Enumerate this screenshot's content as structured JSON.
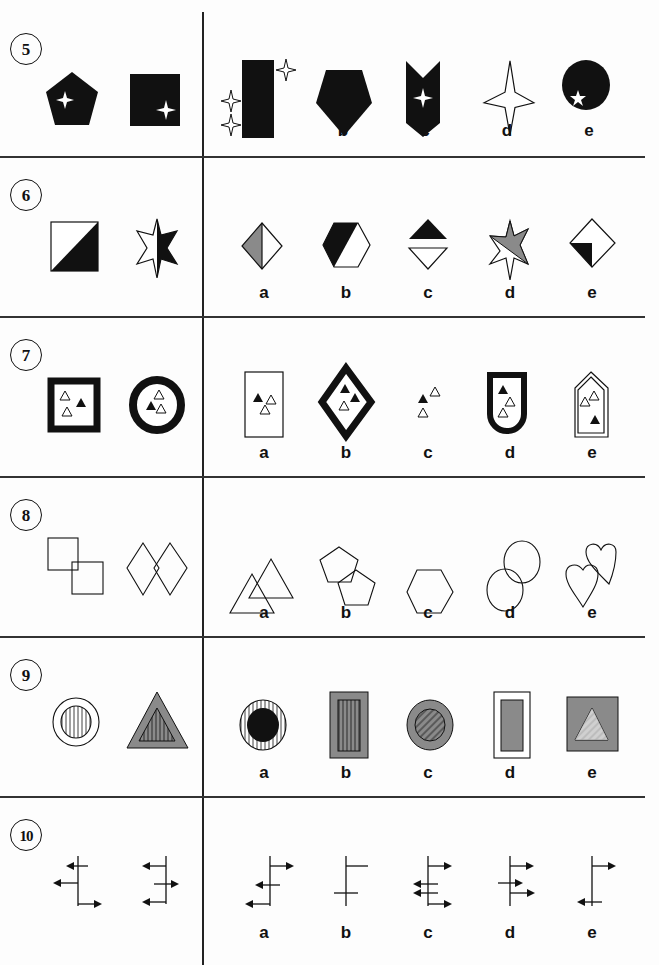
{
  "page": {
    "type": "non-verbal reasoning worksheet",
    "layout": "two-column: example pair on left, answer options a-e on right"
  },
  "questions": [
    {
      "number": "5",
      "example_pair": [
        "black pentagon with white four-point star",
        "black rectangle with white four-point star in lower right"
      ],
      "options": [
        {
          "label": "a",
          "description": "black rectangle with three outlined four-point stars outside"
        },
        {
          "label": "b",
          "description": "black pentagon pointing down"
        },
        {
          "label": "c",
          "description": "black chevron shape with white four-point star"
        },
        {
          "label": "d",
          "description": "outlined four-point star"
        },
        {
          "label": "e",
          "description": "black circle with white five-point star"
        }
      ]
    },
    {
      "number": "6",
      "example_pair": [
        "square split diagonally, lower half black",
        "six-point star, right half black"
      ],
      "options": [
        {
          "label": "a",
          "description": "diamond, left half grey"
        },
        {
          "label": "b",
          "description": "hexagon, left half black"
        },
        {
          "label": "c",
          "description": "black triangle above outlined inverted triangle"
        },
        {
          "label": "d",
          "description": "star, upper half grey"
        },
        {
          "label": "e",
          "description": "diamond with black corner at lower left"
        }
      ]
    },
    {
      "number": "7",
      "example_pair": [
        "thick black square border with three triangles",
        "thick black ring with three triangles"
      ],
      "options": [
        {
          "label": "a",
          "description": "thin rectangle with three triangles"
        },
        {
          "label": "b",
          "description": "thick black diamond with three triangles"
        },
        {
          "label": "c",
          "description": "three triangles without border"
        },
        {
          "label": "d",
          "description": "thick black shield with three triangles"
        },
        {
          "label": "e",
          "description": "double-outlined house shape with three triangles"
        }
      ]
    },
    {
      "number": "8",
      "example_pair": [
        "two overlapping squares",
        "two overlapping diamonds"
      ],
      "options": [
        {
          "label": "a",
          "description": "two overlapping triangles"
        },
        {
          "label": "b",
          "description": "two overlapping pentagons"
        },
        {
          "label": "c",
          "description": "single hexagon"
        },
        {
          "label": "d",
          "description": "two overlapping circles"
        },
        {
          "label": "e",
          "description": "two overlapping hearts"
        }
      ]
    },
    {
      "number": "9",
      "example_pair": [
        "white ring around vertically striped circle",
        "grey triangle border around striped triangle"
      ],
      "options": [
        {
          "label": "a",
          "description": "striped ring around black circle"
        },
        {
          "label": "b",
          "description": "grey rectangle frame around striped rectangle"
        },
        {
          "label": "c",
          "description": "grey ring around diagonally hatched circle"
        },
        {
          "label": "d",
          "description": "white frame around grey rectangle"
        },
        {
          "label": "e",
          "description": "grey square around hatched triangle"
        }
      ]
    },
    {
      "number": "10",
      "example_pair": [
        "vertical line with two left arrows and one right arrow",
        "vertical line with two left arrows and one right arrow (crossing)"
      ],
      "options": [
        {
          "label": "a",
          "description": "line with one right arrow, two left arrows"
        },
        {
          "label": "b",
          "description": "line with plain branches"
        },
        {
          "label": "c",
          "description": "line with two left arrows, two right arrows"
        },
        {
          "label": "d",
          "description": "line with three right arrows"
        },
        {
          "label": "e",
          "description": "line with one right arrow and one left arrow"
        }
      ]
    }
  ],
  "colors": {
    "ink": "#111111",
    "grey_fill": "#8a8a8a",
    "paper": "#fdfdfd"
  }
}
